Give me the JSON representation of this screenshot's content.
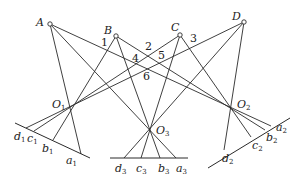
{
  "diagram": {
    "points": [
      {
        "id": "A",
        "label": "A",
        "x": 50,
        "y": 24
      },
      {
        "id": "B",
        "label": "B",
        "x": 116,
        "y": 36
      },
      {
        "id": "C",
        "label": "C",
        "x": 180,
        "y": 35
      },
      {
        "id": "D",
        "label": "D",
        "x": 244,
        "y": 22
      }
    ],
    "centers": [
      {
        "id": "O1",
        "label": "O",
        "sub": "1",
        "x": 69,
        "y": 108
      },
      {
        "id": "O2",
        "label": "O",
        "sub": "2",
        "x": 231,
        "y": 107
      },
      {
        "id": "O3",
        "label": "O",
        "sub": "3",
        "x": 150,
        "y": 129
      }
    ],
    "numbered_intersections": [
      {
        "label": "1",
        "x": 104,
        "y": 42
      },
      {
        "label": "2",
        "x": 147,
        "y": 44
      },
      {
        "label": "3",
        "x": 190,
        "y": 36
      },
      {
        "label": "4",
        "x": 133,
        "y": 54
      },
      {
        "label": "5",
        "x": 159,
        "y": 54
      },
      {
        "label": "6",
        "x": 145,
        "y": 73
      }
    ],
    "projection_lines": [
      {
        "label": "d",
        "sub": "1"
      },
      {
        "label": "c",
        "sub": "1"
      },
      {
        "label": "b",
        "sub": "1"
      },
      {
        "label": "a",
        "sub": "1"
      },
      {
        "label": "d",
        "sub": "3"
      },
      {
        "label": "c",
        "sub": "3"
      },
      {
        "label": "b",
        "sub": "3"
      },
      {
        "label": "a",
        "sub": "3"
      },
      {
        "label": "d",
        "sub": "2"
      },
      {
        "label": "c",
        "sub": "2"
      },
      {
        "label": "b",
        "sub": "2"
      },
      {
        "label": "a",
        "sub": "2"
      }
    ]
  },
  "labels": {
    "A": "A",
    "B": "B",
    "C": "C",
    "D": "D",
    "O": "O",
    "n1": "1",
    "n2": "2",
    "n3": "3",
    "n4": "4",
    "n5": "5",
    "n6": "6",
    "a": "a",
    "b": "b",
    "c": "c",
    "d": "d",
    "s1": "1",
    "s2": "2",
    "s3": "3"
  }
}
